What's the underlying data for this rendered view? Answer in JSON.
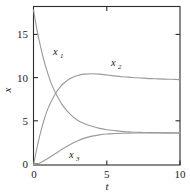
{
  "chart_data": {
    "type": "line",
    "title": "",
    "subtitle": "",
    "xlabel": "t",
    "ylabel": "x",
    "xlim": [
      0,
      10
    ],
    "ylim": [
      0,
      18.4
    ],
    "grid": false,
    "legend_position": "inline-annotations",
    "xticks": [
      0,
      5,
      10
    ],
    "xtick_labels": [
      "0",
      "5",
      "10"
    ],
    "yticks": [
      0,
      5,
      10,
      15
    ],
    "ytick_labels": [
      "0",
      "5",
      "10",
      "15"
    ],
    "x": [
      0,
      0.25,
      0.5,
      0.75,
      1,
      1.25,
      1.5,
      1.75,
      2,
      2.5,
      3,
      3.5,
      4,
      4.5,
      5,
      5.5,
      6,
      6.5,
      7,
      7.5,
      8,
      8.5,
      9,
      9.5,
      10
    ],
    "series": [
      {
        "name": "x1",
        "label": "x",
        "subscript": "1",
        "color": "#9a9a9a",
        "values": [
          18.0,
          15.6,
          13.6,
          11.9,
          10.5,
          9.3,
          8.4,
          7.6,
          6.9,
          5.9,
          5.2,
          4.8,
          4.5,
          4.25,
          4.1,
          4.0,
          3.9,
          3.85,
          3.8,
          3.78,
          3.76,
          3.74,
          3.73,
          3.72,
          3.7
        ],
        "label_x": 2.0,
        "label_y": 12.5,
        "start_value": 18.0,
        "end_value": 3.7,
        "trend": "exponential-decay"
      },
      {
        "name": "x2",
        "label": "x",
        "subscript": "2",
        "color": "#9a9a9a",
        "values": [
          0.0,
          2.1,
          3.9,
          5.4,
          6.6,
          7.5,
          8.3,
          8.9,
          9.4,
          10.05,
          10.4,
          10.55,
          10.6,
          10.55,
          10.45,
          10.35,
          10.25,
          10.2,
          10.12,
          10.08,
          10.03,
          10.0,
          9.97,
          9.95,
          9.9
        ],
        "label_x": 5.4,
        "label_y": 11.6,
        "start_value": 0.0,
        "peak_value": 10.6,
        "peak_x": 4.0,
        "end_value": 9.9,
        "trend": "rise-peak-settle"
      },
      {
        "name": "x3",
        "label": "x",
        "subscript": "3",
        "color": "#9a9a9a",
        "values": [
          0.0,
          0.12,
          0.3,
          0.52,
          0.78,
          1.05,
          1.33,
          1.6,
          1.88,
          2.38,
          2.8,
          3.12,
          3.35,
          3.5,
          3.6,
          3.65,
          3.68,
          3.7,
          3.71,
          3.72,
          3.73,
          3.73,
          3.73,
          3.73,
          3.73
        ],
        "label_x": 2.5,
        "label_y": 1.35,
        "start_value": 0.0,
        "end_value": 3.73,
        "trend": "saturating-rise"
      }
    ],
    "annotations": [
      {
        "text": "x1",
        "x": 2.0,
        "y": 12.5
      },
      {
        "text": "x2",
        "x": 5.4,
        "y": 11.6
      },
      {
        "text": "x3",
        "x": 2.5,
        "y": 1.35
      }
    ],
    "crossings": [
      {
        "series": [
          "x1",
          "x2"
        ],
        "x": 1.6,
        "y": 8.2
      }
    ]
  },
  "axes": {
    "x_title": "t",
    "y_title": "x",
    "x_tick_labels": [
      "0",
      "5",
      "10"
    ],
    "y_tick_labels": [
      "0",
      "5",
      "10",
      "15"
    ]
  },
  "colors": {
    "curve": "#9a9a9a",
    "frame": "#2b2b2b",
    "text": "#1a1a1a",
    "background": "#ffffff"
  }
}
